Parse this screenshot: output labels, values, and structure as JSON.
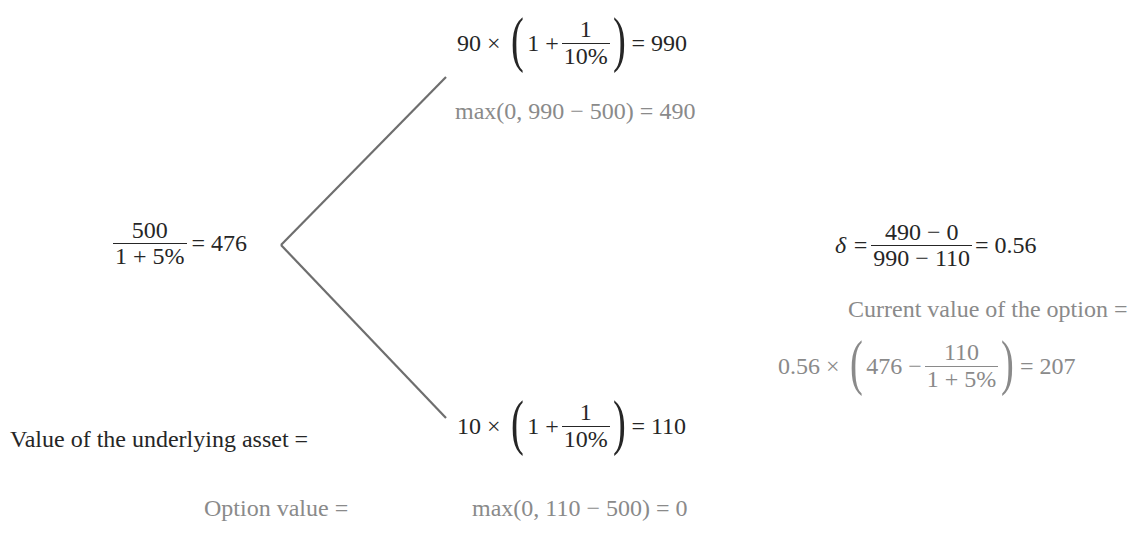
{
  "tree": {
    "root": {
      "numerator": "500",
      "denominator": "1 + 5%",
      "equals": "= 476"
    },
    "up": {
      "asset": {
        "factor": "90 ×",
        "inner": "1 +",
        "frac_num": "1",
        "frac_den": "10%",
        "result": "= 990"
      },
      "option": "max(0, 990 − 500) = 490"
    },
    "down": {
      "asset": {
        "factor": "10 ×",
        "inner": "1 +",
        "frac_num": "1",
        "frac_den": "10%",
        "result": "= 110"
      },
      "option": "max(0, 110 − 500) = 0"
    },
    "line_color": "#6e6e6e"
  },
  "labels": {
    "underlying": "Value of the underlying asset =",
    "option_value": "Option value ="
  },
  "delta": {
    "symbol": "δ =",
    "numerator": "490 − 0",
    "denominator": "990 − 110",
    "result": "= 0.56"
  },
  "current": {
    "label": "Current value of the option =",
    "factor": "0.56 ×",
    "inner": "476 −",
    "frac_num": "110",
    "frac_den": "1 + 5%",
    "result": "= 207"
  },
  "colors": {
    "dark_text": "#262626",
    "gray_text": "#8a8a8a"
  }
}
